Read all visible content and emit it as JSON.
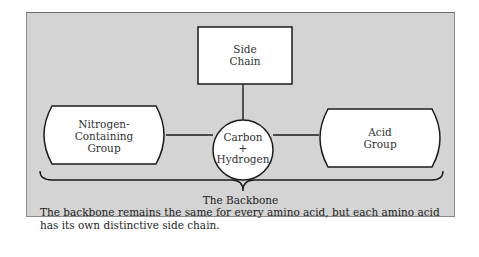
{
  "diagram": {
    "nodes": {
      "side_chain": {
        "line1": "Side",
        "line2": "Chain"
      },
      "center": {
        "line1": "Carbon",
        "line2": "+",
        "line3": "Hydrogen"
      },
      "nitrogen_group": {
        "line1": "Nitrogen-",
        "line2": "Containing",
        "line3": "Group"
      },
      "acid_group": {
        "line1": "Acid",
        "line2": "Group"
      }
    },
    "brace_label": "The Backbone",
    "caption": "The backbone remains the same for every amino acid, but each amino acid has its own distinctive side chain."
  },
  "colors": {
    "panel_background": "#d4d4d4",
    "node_fill": "#ffffff",
    "stroke": "#1a1a1a"
  }
}
